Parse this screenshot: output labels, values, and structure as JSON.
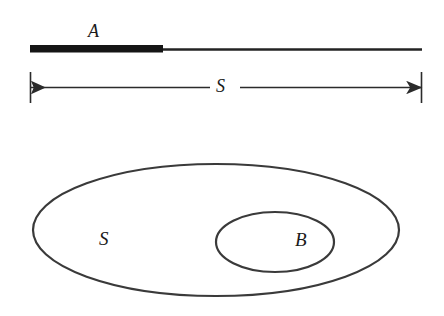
{
  "figure": {
    "caption_visible": false,
    "background_color": "#ffffff",
    "stroke_color": "#3a3a3a",
    "fill_color": "#1a1a1a",
    "panels": [
      {
        "name": "interval-panel",
        "description": "Horizontal line segment S with a thickened sub-segment A at its left portion, and a dimension arrow spanning the full extent of S",
        "elements": [
          {
            "name": "segment-a-bar",
            "kind": "thick-bar",
            "label": "A",
            "x_start": 30,
            "x_end": 163,
            "y": 48,
            "thickness": 7
          },
          {
            "name": "segment-s-line",
            "kind": "thin-line",
            "label": "S",
            "x_start": 30,
            "x_end": 422,
            "y": 49,
            "thickness": 2
          },
          {
            "name": "dimension-line-s",
            "kind": "double-arrow",
            "label": "S",
            "x_start": 30,
            "x_end": 422,
            "y": 87,
            "tick_top": 72,
            "tick_bottom": 102
          }
        ]
      },
      {
        "name": "venn-panel",
        "description": "Large ellipse labeled S containing a smaller ellipse labeled B",
        "elements": [
          {
            "name": "outer-ellipse-s",
            "kind": "ellipse",
            "label": "S",
            "cx": 216,
            "cy": 230,
            "rx": 183,
            "ry": 66
          },
          {
            "name": "inner-ellipse-b",
            "kind": "ellipse",
            "label": "B",
            "cx": 275,
            "cy": 242,
            "rx": 59,
            "ry": 30
          }
        ]
      }
    ]
  },
  "labels": {
    "a": "A",
    "s_dimension": "S",
    "s_set": "S",
    "b_set": "B"
  }
}
